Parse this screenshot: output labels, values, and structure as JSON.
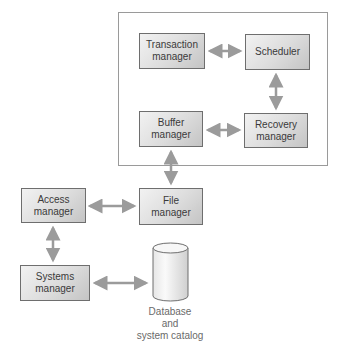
{
  "diagram": {
    "container_label": "",
    "boxes": {
      "transaction_manager": {
        "line1": "Transaction",
        "line2": "manager"
      },
      "scheduler": {
        "line1": "Scheduler"
      },
      "buffer_manager": {
        "line1": "Buffer",
        "line2": "manager"
      },
      "recovery_manager": {
        "line1": "Recovery",
        "line2": "manager"
      },
      "file_manager": {
        "line1": "File",
        "line2": "manager"
      },
      "access_manager": {
        "line1": "Access",
        "line2": "manager"
      },
      "systems_manager": {
        "line1": "Systems",
        "line2": "manager"
      }
    },
    "database": {
      "caption_line1": "Database",
      "caption_line2": "and",
      "caption_line3": "system catalog"
    },
    "connections": [
      {
        "from": "Transaction manager",
        "to": "Scheduler",
        "type": "bidirectional"
      },
      {
        "from": "Scheduler",
        "to": "Recovery manager",
        "type": "bidirectional"
      },
      {
        "from": "Buffer manager",
        "to": "Recovery manager",
        "type": "bidirectional"
      },
      {
        "from": "Buffer manager",
        "to": "File manager",
        "type": "bidirectional"
      },
      {
        "from": "Access manager",
        "to": "File manager",
        "type": "bidirectional"
      },
      {
        "from": "Access manager",
        "to": "Systems manager",
        "type": "bidirectional"
      },
      {
        "from": "Systems manager",
        "to": "Database and system catalog",
        "type": "bidirectional"
      }
    ],
    "colors": {
      "arrow": "#9b9b9b",
      "box_border": "#6e6e6e",
      "container_border": "#9a9a9a",
      "text": "#3a3a3a",
      "caption": "#6a6a6a"
    }
  }
}
